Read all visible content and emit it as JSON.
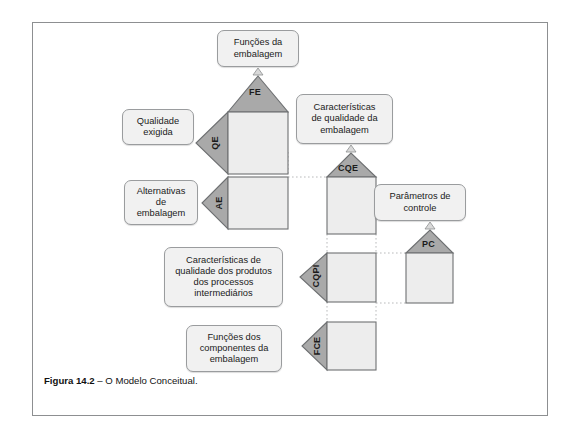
{
  "figure": {
    "caption_label": "Figura 14.2",
    "caption_dash": " – ",
    "caption_text": "O Modelo Conceitual."
  },
  "colors": {
    "roof_fill": "#a9a9a9",
    "body_fill": "#ededed",
    "arrow_fill": "#a9a9a9",
    "stroke": "#6e7072",
    "box_fill": "#f1f1f1",
    "box_stroke": "#9a9c9e",
    "frame_stroke": "#8d8f91",
    "connector": "#b9babb",
    "text": "#1b1b1b"
  },
  "diagram": {
    "type": "house-of-quality-cascade",
    "title": "O Modelo Conceitual",
    "boxes": [
      {
        "id": "fe-box",
        "text_lines": [
          "Funções da",
          "embalagem"
        ]
      },
      {
        "id": "qe-box",
        "text_lines": [
          "Qualidade",
          "exigida"
        ]
      },
      {
        "id": "cqe-box",
        "text_lines": [
          "Características",
          "de qualidade da",
          "embalagem"
        ]
      },
      {
        "id": "ae-box",
        "text_lines": [
          "Alternativas",
          "de",
          "embalagem"
        ]
      },
      {
        "id": "pc-box",
        "text_lines": [
          "Parâmetros de",
          "controle"
        ]
      },
      {
        "id": "cqpi-box",
        "text_lines": [
          "Características de",
          "qualidade dos produtos",
          "dos processos",
          "intermediários"
        ]
      },
      {
        "id": "fce-box",
        "text_lines": [
          "Funções dos",
          "componentes da",
          "embalagem"
        ]
      }
    ],
    "houses": [
      {
        "id": "house-1",
        "roof_tag": "FE",
        "side_tag": "QE",
        "has_roof": true,
        "has_arrow": true
      },
      {
        "id": "house-2",
        "roof_tag": "",
        "side_tag": "AE",
        "has_roof": false,
        "has_arrow": true
      },
      {
        "id": "house-3",
        "roof_tag": "CQE",
        "side_tag": "",
        "has_roof": true,
        "has_arrow": false
      },
      {
        "id": "house-4",
        "roof_tag": "PC",
        "side_tag": "",
        "has_roof": true,
        "has_arrow": false
      },
      {
        "id": "house-5",
        "roof_tag": "",
        "side_tag": "CQPI",
        "has_roof": false,
        "has_arrow": true
      },
      {
        "id": "house-6",
        "roof_tag": "",
        "side_tag": "FCE",
        "has_roof": false,
        "has_arrow": true
      }
    ],
    "tags": {
      "fe": "FE",
      "qe": "QE",
      "ae": "AE",
      "cqe": "CQE",
      "pc": "PC",
      "cqpi": "CQPI",
      "fce": "FCE"
    }
  }
}
